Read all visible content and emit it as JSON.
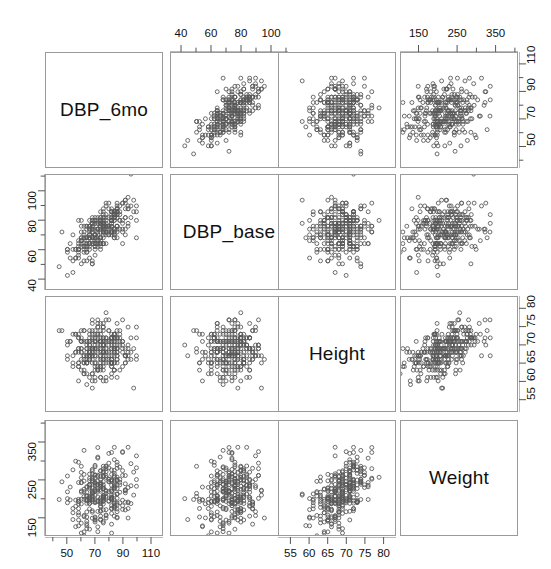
{
  "figure": {
    "type": "scatterplot-matrix",
    "variables": [
      "DBP_6mo",
      "DBP_base",
      "Height",
      "Weight"
    ],
    "point_color": "#5a5a5a",
    "panel_border_color": "#9a9a9a",
    "background": "#ffffff"
  },
  "diagonal_labels": [
    "DBP_6mo",
    "DBP_base",
    "Height",
    "Weight"
  ],
  "axes": {
    "top": [
      {
        "column": 2,
        "variable": "DBP_base",
        "labels": [
          "40",
          "60",
          "80",
          "100"
        ],
        "values": [
          40,
          60,
          80,
          100
        ],
        "minor_ticks": [
          30,
          50,
          70,
          90,
          110
        ]
      },
      {
        "column": 4,
        "variable": "Weight",
        "labels": [
          "150",
          "250",
          "350"
        ],
        "values": [
          150,
          250,
          350
        ],
        "minor_ticks": [
          100,
          200,
          300,
          400
        ]
      }
    ],
    "bottom": [
      {
        "column": 1,
        "variable": "DBP_6mo",
        "labels": [
          "50",
          "70",
          "90",
          "110"
        ],
        "values": [
          50,
          70,
          90,
          110
        ],
        "minor_ticks": [
          40,
          60,
          80,
          100
        ]
      },
      {
        "column": 3,
        "variable": "Height",
        "labels": [
          "55",
          "60",
          "65",
          "70",
          "75",
          "80"
        ],
        "values": [
          55,
          60,
          65,
          70,
          75,
          80
        ],
        "minor_ticks": []
      }
    ],
    "left": [
      {
        "row": 2,
        "variable": "DBP_base",
        "labels": [
          "40",
          "60",
          "80",
          "100"
        ],
        "values": [
          40,
          60,
          80,
          100
        ],
        "minor_ticks": [
          30,
          50,
          70,
          90,
          110
        ]
      },
      {
        "row": 4,
        "variable": "Weight",
        "labels": [
          "150",
          "250",
          "350"
        ],
        "values": [
          150,
          250,
          350
        ],
        "minor_ticks": [
          100,
          200,
          300,
          400
        ]
      }
    ],
    "right": [
      {
        "row": 1,
        "variable": "DBP_6mo",
        "labels": [
          "50",
          "70",
          "90",
          "110"
        ],
        "values": [
          50,
          70,
          90,
          110
        ],
        "minor_ticks": [
          40,
          60,
          80,
          100
        ]
      },
      {
        "row": 3,
        "variable": "Height",
        "labels": [
          "55",
          "60",
          "65",
          "70",
          "75",
          "80"
        ],
        "values": [
          55,
          60,
          65,
          70,
          75,
          80
        ],
        "minor_ticks": []
      }
    ]
  },
  "chart_data": {
    "type": "scatter",
    "title": "",
    "subtitle": "",
    "xlabel": "",
    "ylabel": "",
    "grid": false,
    "legend": "none",
    "matrix": true,
    "variables": [
      {
        "name": "DBP_6mo",
        "range": [
          38,
          115
        ],
        "tick_labels": [
          "50",
          "70",
          "90",
          "110"
        ],
        "ticks": [
          50,
          70,
          90,
          110
        ]
      },
      {
        "name": "DBP_base",
        "range": [
          36,
          108
        ],
        "tick_labels": [
          "40",
          "60",
          "80",
          "100"
        ],
        "ticks": [
          40,
          60,
          80,
          100
        ]
      },
      {
        "name": "Height",
        "range": [
          53,
          82
        ],
        "tick_labels": [
          "55",
          "60",
          "65",
          "70",
          "75",
          "80"
        ],
        "ticks": [
          55,
          60,
          65,
          70,
          75,
          80
        ]
      },
      {
        "name": "Weight",
        "range": [
          115,
          395
        ],
        "tick_labels": [
          "150",
          "250",
          "350"
        ],
        "ticks": [
          150,
          250,
          350
        ]
      }
    ],
    "n_points": 320,
    "correlations": [
      {
        "x": "DBP_base",
        "y": "DBP_6mo",
        "r": 0.72
      },
      {
        "x": "Height",
        "y": "DBP_6mo",
        "r": 0.12
      },
      {
        "x": "Weight",
        "y": "DBP_6mo",
        "r": 0.22
      },
      {
        "x": "DBP_6mo",
        "y": "DBP_base",
        "r": 0.72
      },
      {
        "x": "Height",
        "y": "DBP_base",
        "r": 0.1
      },
      {
        "x": "Weight",
        "y": "DBP_base",
        "r": 0.2
      },
      {
        "x": "DBP_6mo",
        "y": "Height",
        "r": 0.12
      },
      {
        "x": "DBP_base",
        "y": "Height",
        "r": 0.1
      },
      {
        "x": "Weight",
        "y": "Height",
        "r": 0.52
      },
      {
        "x": "DBP_6mo",
        "y": "Weight",
        "r": 0.22
      },
      {
        "x": "DBP_base",
        "y": "Weight",
        "r": 0.2
      },
      {
        "x": "Height",
        "y": "Weight",
        "r": 0.52
      }
    ],
    "distributions": {
      "DBP_6mo": {
        "mean": 74,
        "sd": 11
      },
      "DBP_base": {
        "mean": 74,
        "sd": 11
      },
      "Height": {
        "mean": 68.5,
        "sd": 3.8
      },
      "Weight": {
        "mean": 215,
        "sd": 48
      }
    },
    "marker": {
      "shape": "circle",
      "filled": false,
      "size": 4,
      "color": "#5a5a5a"
    }
  },
  "layout": {
    "panel_left": [
      45,
      170,
      278,
      400
    ],
    "panel_top": [
      52,
      174,
      296,
      420
    ],
    "panel_w": 118,
    "panel_h": 116
  }
}
